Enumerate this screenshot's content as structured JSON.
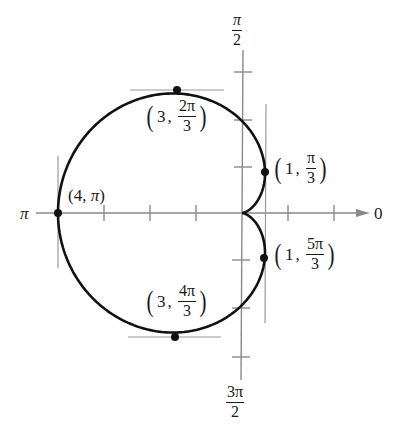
{
  "chart_data": {
    "type": "line",
    "title": "",
    "coordinate_system": "polar",
    "equation": "r = 2 - 2cos(theta)",
    "curve_name": "cardioid",
    "axis_labels": {
      "right": "0",
      "top_num": "π",
      "top_den": "2",
      "left": "π",
      "bottom_num": "3π",
      "bottom_den": "2"
    },
    "tick_spacing": 1,
    "ticks_per_direction": {
      "right": 2,
      "left": 3,
      "up": 3,
      "down": 3
    },
    "labeled_points": [
      {
        "r": 4,
        "theta": "π",
        "label_r": "4",
        "label_theta": "π",
        "tangent": "vertical"
      },
      {
        "r": 3,
        "theta": "2π/3",
        "label_r": "3",
        "label_num": "2π",
        "label_den": "3",
        "tangent": "horizontal"
      },
      {
        "r": 1,
        "theta": "π/3",
        "label_r": "1",
        "label_num": "π",
        "label_den": "3",
        "tangent": "vertical"
      },
      {
        "r": 1,
        "theta": "5π/3",
        "label_r": "1",
        "label_num": "5π",
        "label_den": "3",
        "tangent": "vertical"
      },
      {
        "r": 3,
        "theta": "4π/3",
        "label_r": "3",
        "label_num": "4π",
        "label_den": "3",
        "tangent": "horizontal"
      }
    ],
    "xlim": [
      -4.1,
      2.8
    ],
    "ylim": [
      -3.6,
      3.6
    ],
    "grid": false,
    "legend": null
  },
  "colors": {
    "curve": "#111111",
    "axis": "#8a8a8a",
    "tangent": "#9a9a9a",
    "point": "#111111"
  }
}
